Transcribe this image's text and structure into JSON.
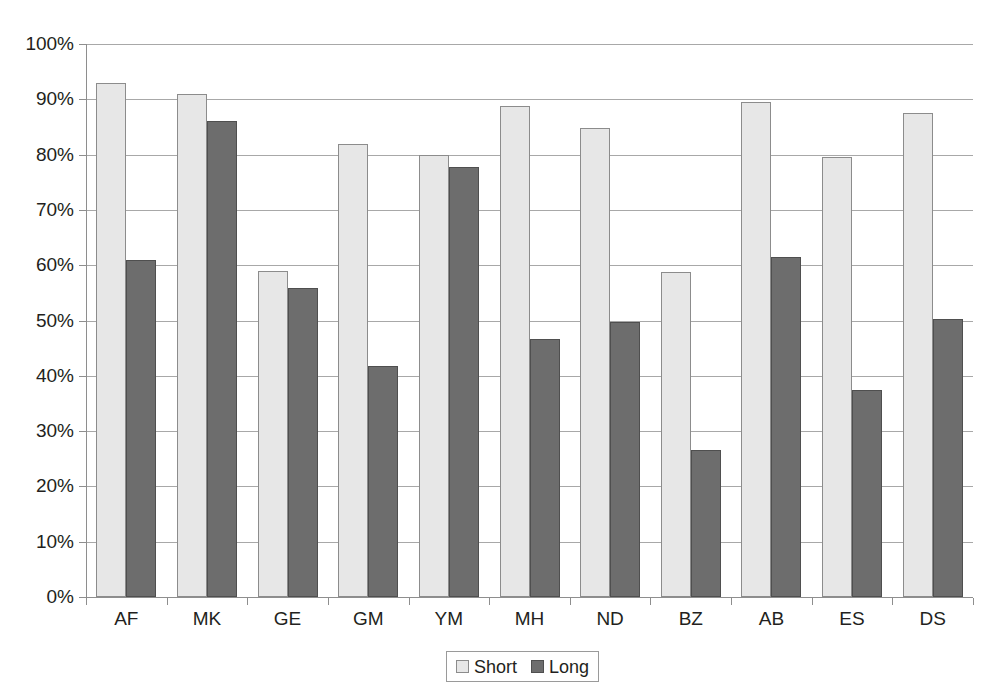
{
  "chart_data": {
    "type": "bar",
    "title": "",
    "subtitle": "",
    "xlabel": "",
    "ylabel": "",
    "ylim": [
      0,
      100
    ],
    "y_unit": "%",
    "grid": true,
    "legend_position": "bottom-center",
    "categories": [
      "AF",
      "MK",
      "GE",
      "GM",
      "YM",
      "MH",
      "ND",
      "BZ",
      "AB",
      "ES",
      "DS"
    ],
    "ytick_labels": [
      "0%",
      "10%",
      "20%",
      "30%",
      "40%",
      "50%",
      "60%",
      "70%",
      "80%",
      "90%",
      "100%"
    ],
    "ytick_values": [
      0,
      10,
      20,
      30,
      40,
      50,
      60,
      70,
      80,
      90,
      100
    ],
    "series": [
      {
        "name": "Short",
        "color": "#e7e7e7",
        "values": [
          93.0,
          91.0,
          59.0,
          82.0,
          80.0,
          88.8,
          84.8,
          58.7,
          89.6,
          79.5,
          87.6
        ]
      },
      {
        "name": "Long",
        "color": "#6d6d6d",
        "values": [
          61.0,
          86.0,
          55.8,
          41.8,
          77.8,
          46.7,
          49.8,
          26.5,
          61.5,
          37.5,
          50.3
        ]
      }
    ],
    "legend": [
      {
        "label": "Short",
        "swatch": "light-gray-swatch"
      },
      {
        "label": "Long",
        "swatch": "dark-gray-swatch"
      }
    ]
  },
  "colors": {
    "short_fill": "#e7e7e7",
    "long_fill": "#6d6d6d",
    "bar_border": "#8c8c8c",
    "gridline": "#a8a8a8",
    "axis": "#8e8e8e",
    "text": "#231f20",
    "background": "#ffffff"
  }
}
